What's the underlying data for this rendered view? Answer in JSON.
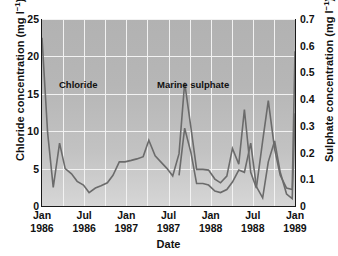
{
  "chart_data": {
    "type": "line",
    "title": "",
    "xlabel": "Date",
    "ylabel": "Chloride concentration (mg l-1)",
    "ylabel_secondary": "Sulphate concentration (mg l-1)",
    "grid": true,
    "legend_position": "inline-annotations",
    "ylim": [
      0,
      25
    ],
    "ylim_secondary": [
      0,
      0.7
    ],
    "yticks": [
      "0",
      "5",
      "10",
      "15",
      "20",
      "25"
    ],
    "yticks_secondary": [
      "0",
      "0.1",
      "0.2",
      "0.3",
      "0.4",
      "0.5",
      "0.6",
      "0.7"
    ],
    "xticks": [
      {
        "month": "Jan",
        "year": "1986"
      },
      {
        "month": "Jul",
        "year": "1986"
      },
      {
        "month": "Jan",
        "year": "1987"
      },
      {
        "month": "Jul",
        "year": "1987"
      },
      {
        "month": "Jan",
        "year": "1988"
      },
      {
        "month": "Jul",
        "year": "1988"
      },
      {
        "month": "Jan",
        "year": "1989"
      }
    ],
    "x_range": [
      "Jan 1986",
      "Jan 1989"
    ],
    "line_color": "#6b6b6b",
    "plot_background": "#b8b8b8",
    "gridline_color": "#f2f2f2",
    "series": [
      {
        "name": "Chloride",
        "axis": "left",
        "units": "mg l-1",
        "annotation_label": "Chloride",
        "x": [
          0.0,
          0.8,
          1.6,
          2.5,
          3.3,
          4.2,
          5.0,
          5.9,
          6.7,
          7.6,
          8.4,
          9.3,
          10.1,
          11.0,
          11.8,
          12.7,
          13.5,
          14.4,
          15.2,
          16.1,
          16.9,
          17.8,
          18.6,
          19.5,
          20.3,
          21.2,
          22.0,
          22.9,
          23.7,
          24.6,
          25.4,
          26.3,
          27.1,
          28.0,
          28.8,
          29.7,
          30.5,
          31.4,
          32.2,
          33.1,
          33.9,
          34.8,
          35.6,
          36.0
        ],
        "values": [
          22.5,
          9.8,
          2.5,
          8.4,
          5.0,
          4.3,
          3.3,
          2.8,
          1.8,
          2.4,
          2.7,
          3.1,
          4.1,
          5.9,
          5.9,
          6.1,
          6.3,
          6.6,
          8.8,
          6.7,
          5.9,
          5.0,
          4.0,
          7.0,
          16.5,
          10.4,
          4.9,
          4.9,
          4.8,
          3.6,
          3.1,
          4.0,
          7.7,
          5.6,
          12.9,
          4.5,
          2.4,
          8.7,
          14.1,
          7.6,
          4.1,
          2.4,
          2.2,
          20.7
        ]
      },
      {
        "name": "Marine sulphate",
        "axis": "right",
        "units": "mg l-1",
        "annotation_label": "Marine sulphate",
        "x": [
          19.5,
          20.3,
          21.2,
          22.0,
          22.9,
          23.7,
          24.6,
          25.4,
          26.3,
          27.1,
          28.0,
          28.8,
          29.7,
          30.5,
          31.4,
          32.2,
          33.1,
          33.9,
          34.8,
          35.6,
          36.0
        ],
        "values_mgl": [
          0.115,
          0.29,
          0.2,
          0.085,
          0.085,
          0.078,
          0.055,
          0.05,
          0.062,
          0.09,
          0.135,
          0.125,
          0.235,
          0.072,
          0.032,
          0.165,
          0.245,
          0.125,
          0.045,
          0.028,
          0.345
        ],
        "values_on_left_scale": [
          4.1,
          10.4,
          7.1,
          3.0,
          3.0,
          2.8,
          2.0,
          1.8,
          2.2,
          3.2,
          4.8,
          4.5,
          8.4,
          2.6,
          1.1,
          5.9,
          8.7,
          4.5,
          1.6,
          1.0,
          12.4
        ]
      }
    ]
  }
}
